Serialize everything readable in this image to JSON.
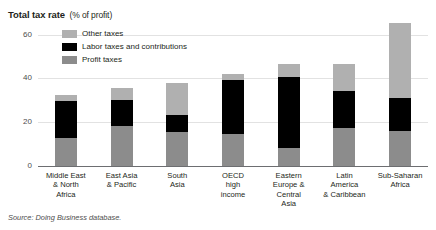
{
  "title": {
    "main": "Total tax rate",
    "unit": "(% of profit)"
  },
  "source": "Source: Doing Business database.",
  "legend": {
    "position": "top-left-inside",
    "items": [
      {
        "label": "Other taxes",
        "color": "#b0b0b0",
        "name": "legend-other-taxes"
      },
      {
        "label": "Labor taxes and contributions",
        "color": "#000000",
        "name": "legend-labor-taxes"
      },
      {
        "label": "Profit taxes",
        "color": "#8c8c8c",
        "name": "legend-profit-taxes"
      }
    ]
  },
  "axis": {
    "y_ticks": [
      "0",
      "20",
      "40",
      "60"
    ],
    "y_values": [
      0,
      20,
      40,
      60
    ],
    "ylim": [
      0,
      68
    ],
    "grid": true
  },
  "chart_data": {
    "type": "bar",
    "stacked": true,
    "title": "Total tax rate (% of profit)",
    "xlabel": "",
    "ylabel": "% of profit",
    "ylim": [
      0,
      68
    ],
    "yticks": [
      0,
      20,
      40,
      60
    ],
    "grid": true,
    "legend_position": "top-left-inside",
    "categories": [
      "Middle East & North Africa",
      "East Asia & Pacific",
      "South Asia",
      "OECD high income",
      "Eastern Europe & Central Asia",
      "Latin America & Caribbean",
      "Sub-Saharan Africa"
    ],
    "category_lines": [
      [
        "Middle East",
        "& North",
        "Africa"
      ],
      [
        "East Asia",
        "& Pacific"
      ],
      [
        "South",
        "Asia"
      ],
      [
        "OECD",
        "high",
        "income"
      ],
      [
        "Eastern",
        "Europe &",
        "Central",
        "Asia"
      ],
      [
        "Latin",
        "America",
        "& Caribbean"
      ],
      [
        "Sub-Saharan",
        "Africa"
      ]
    ],
    "series": [
      {
        "name": "Profit taxes",
        "color": "#8c8c8c",
        "values": [
          12.6,
          18.3,
          15.7,
          14.8,
          8.3,
          17.4,
          16.1
        ]
      },
      {
        "name": "Labor taxes and contributions",
        "color": "#000000",
        "values": [
          17.0,
          11.7,
          7.8,
          24.3,
          32.2,
          17.0,
          14.8
        ]
      },
      {
        "name": "Other taxes",
        "color": "#b0b0b0",
        "values": [
          3.0,
          5.7,
          14.3,
          3.1,
          6.0,
          12.1,
          34.3
        ]
      }
    ],
    "totals": [
      32.6,
      35.7,
      37.8,
      42.2,
      46.5,
      46.5,
      65.2
    ]
  }
}
